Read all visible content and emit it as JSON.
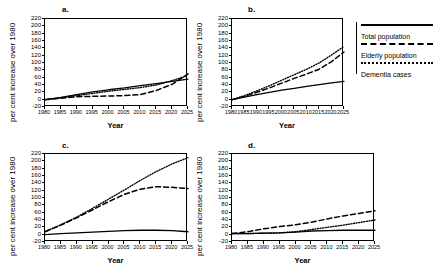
{
  "figure": {
    "axis_label_y": "per cent increase over 1980",
    "axis_label_x": "Year",
    "panel_letters": [
      "a.",
      "b.",
      "c.",
      "d."
    ],
    "y_ticks": [
      "220",
      "200",
      "180",
      "160",
      "140",
      "120",
      "100",
      "80",
      "60",
      "40",
      "20",
      "0",
      "-20"
    ],
    "x_ticks": [
      "1980",
      "1985",
      "1990",
      "1995",
      "2000",
      "2005",
      "2010",
      "2015",
      "2020",
      "2025"
    ]
  },
  "legend": {
    "items": [
      {
        "label": "Total population",
        "style": "solid"
      },
      {
        "label": "Elderly population",
        "style": "dashed"
      },
      {
        "label": "Dementia cases",
        "style": "dotted"
      }
    ]
  },
  "chart_data": [
    {
      "type": "line",
      "panel": "a.",
      "title": "a.",
      "xlabel": "Year",
      "ylabel": "per cent increase over 1980",
      "xlim": [
        1980,
        2025
      ],
      "ylim": [
        -20,
        220
      ],
      "grid": false,
      "x": [
        1980,
        1985,
        1990,
        1995,
        2000,
        2005,
        2010,
        2015,
        2020,
        2025
      ],
      "series": [
        {
          "name": "Total population",
          "style": "solid",
          "values": [
            0,
            6,
            14,
            21,
            27,
            32,
            38,
            44,
            50,
            56
          ]
        },
        {
          "name": "Elderly population",
          "style": "dashed",
          "values": [
            0,
            4,
            8,
            9,
            10,
            11,
            14,
            25,
            42,
            70
          ]
        },
        {
          "name": "Dementia cases",
          "style": "dotted",
          "values": [
            0,
            5,
            11,
            17,
            23,
            28,
            33,
            40,
            52,
            66
          ]
        }
      ]
    },
    {
      "type": "line",
      "panel": "b.",
      "title": "b.",
      "xlabel": "Year",
      "ylabel": "per cent increase over 1980",
      "xlim": [
        1980,
        2025
      ],
      "ylim": [
        -20,
        220
      ],
      "grid": false,
      "x": [
        1980,
        1985,
        1990,
        1995,
        2000,
        2005,
        2010,
        2015,
        2020,
        2025
      ],
      "series": [
        {
          "name": "Total population",
          "style": "solid",
          "values": [
            0,
            7,
            14,
            20,
            26,
            31,
            36,
            41,
            46,
            50
          ]
        },
        {
          "name": "Elderly population",
          "style": "dashed",
          "values": [
            0,
            9,
            20,
            32,
            45,
            58,
            70,
            83,
            104,
            130
          ]
        },
        {
          "name": "Dementia cases",
          "style": "dotted",
          "values": [
            0,
            11,
            24,
            38,
            53,
            68,
            83,
            100,
            122,
            145
          ]
        }
      ]
    },
    {
      "type": "line",
      "panel": "c.",
      "title": "c.",
      "xlabel": "Year",
      "ylabel": "per cent increase over 1980",
      "xlim": [
        1980,
        2025
      ],
      "ylim": [
        -20,
        220
      ],
      "grid": false,
      "x": [
        1980,
        1985,
        1990,
        1995,
        2000,
        2005,
        2010,
        2015,
        2020,
        2025
      ],
      "series": [
        {
          "name": "Total population",
          "style": "solid",
          "values": [
            0,
            3,
            5,
            7,
            9,
            11,
            12,
            12,
            11,
            8
          ]
        },
        {
          "name": "Elderly population",
          "style": "dashed",
          "values": [
            8,
            26,
            46,
            68,
            90,
            110,
            124,
            131,
            129,
            126
          ]
        },
        {
          "name": "Dementia cases",
          "style": "dotted",
          "values": [
            8,
            27,
            48,
            72,
            97,
            122,
            148,
            172,
            193,
            210
          ]
        }
      ]
    },
    {
      "type": "line",
      "panel": "d.",
      "title": "d.",
      "xlabel": "Year",
      "ylabel": "per cent increase over 1980",
      "xlim": [
        1980,
        2025
      ],
      "ylim": [
        -20,
        220
      ],
      "grid": false,
      "x": [
        1980,
        1985,
        1990,
        1995,
        2000,
        2005,
        2010,
        2015,
        2020,
        2025
      ],
      "series": [
        {
          "name": "Total population",
          "style": "solid",
          "values": [
            3,
            3,
            4,
            5,
            7,
            10,
            11,
            12,
            12,
            12
          ]
        },
        {
          "name": "Elderly population",
          "style": "dashed",
          "values": [
            3,
            8,
            16,
            22,
            27,
            34,
            43,
            51,
            58,
            65
          ]
        },
        {
          "name": "Dementia cases",
          "style": "dotted",
          "values": [
            3,
            3,
            4,
            5,
            8,
            14,
            20,
            26,
            33,
            40
          ]
        }
      ]
    }
  ]
}
